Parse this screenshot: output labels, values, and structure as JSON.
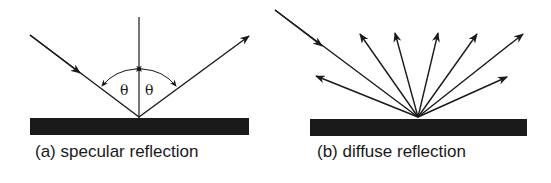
{
  "panels": [
    {
      "id": "a",
      "caption": "(a) specular reflection",
      "angle_labels": [
        "θ",
        "θ"
      ],
      "rays": {
        "incident": 1,
        "reflected": 1
      },
      "has_normal": true
    },
    {
      "id": "b",
      "caption": "(b) diffuse reflection",
      "rays": {
        "incident": 1,
        "reflected": 7
      },
      "has_normal": false
    }
  ],
  "colors": {
    "ink": "#1a1a1a",
    "background": "#ffffff"
  }
}
